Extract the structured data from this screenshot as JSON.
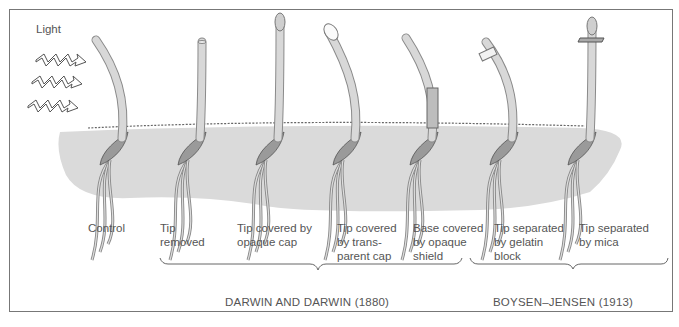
{
  "figure": {
    "light_label": "Light",
    "light_icon": "zigzag-light-arrow-icon",
    "experiments": [
      {
        "id": "control",
        "label": "Control",
        "treatment": "none",
        "bends": true
      },
      {
        "id": "tip-removed",
        "label": "Tip\nremoved",
        "treatment": "tip removed",
        "bends": false
      },
      {
        "id": "opaque-cap",
        "label": "Tip covered by\nopaque cap",
        "treatment": "opaque cap on tip",
        "bends": false
      },
      {
        "id": "transparent-cap",
        "label": "Tip covered\nby trans-\nparent cap",
        "treatment": "transparent cap on tip",
        "bends": true
      },
      {
        "id": "opaque-shield",
        "label": "Base covered\nby opaque\nshield",
        "treatment": "opaque shield on base",
        "bends": true
      },
      {
        "id": "gelatin-block",
        "label": "Tip separated\nby gelatin\nblock",
        "treatment": "gelatin block below tip",
        "bends": true
      },
      {
        "id": "mica",
        "label": "Tip separated\nby mica",
        "treatment": "mica plate below tip",
        "bends": false
      }
    ],
    "groups": [
      {
        "label": "DARWIN AND DARWIN (1880)",
        "spans": [
          "tip-removed",
          "opaque-cap",
          "transparent-cap",
          "opaque-shield"
        ]
      },
      {
        "label": "BOYSEN–JENSEN (1913)",
        "spans": [
          "gelatin-block",
          "mica"
        ]
      }
    ]
  },
  "colors": {
    "soil": "#d9d9d9",
    "coleoptile": "#d8d8d8",
    "coleoptile_edge": "#8a8a8a",
    "seed": "#9a9a9a",
    "frame": "#777777",
    "text": "#555555"
  }
}
